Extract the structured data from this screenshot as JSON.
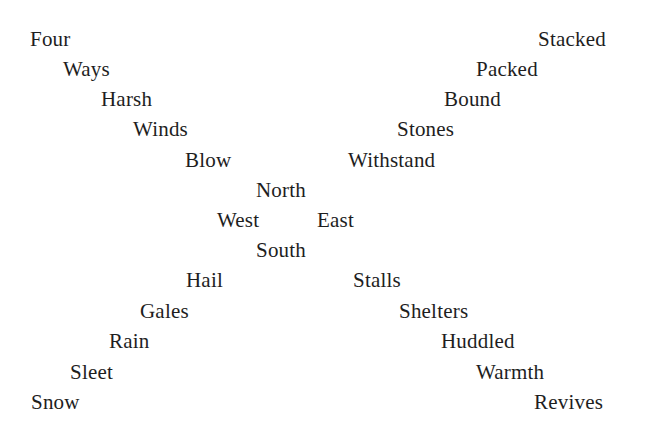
{
  "poem": {
    "left_arm_top": [
      {
        "text": "Four",
        "x": 30,
        "y": 27
      },
      {
        "text": "Ways",
        "x": 63,
        "y": 57
      },
      {
        "text": "Harsh",
        "x": 101,
        "y": 87
      },
      {
        "text": "Winds",
        "x": 133,
        "y": 117
      },
      {
        "text": "Blow",
        "x": 185,
        "y": 148
      }
    ],
    "right_arm_top": [
      {
        "text": "Stacked",
        "x": 538,
        "y": 27
      },
      {
        "text": "Packed",
        "x": 476,
        "y": 57
      },
      {
        "text": "Bound",
        "x": 444,
        "y": 87
      },
      {
        "text": "Stones",
        "x": 397,
        "y": 117
      },
      {
        "text": "Withstand",
        "x": 348,
        "y": 148
      }
    ],
    "center": {
      "north": {
        "text": "North",
        "x": 256,
        "y": 178
      },
      "west": {
        "text": "West",
        "x": 217,
        "y": 208
      },
      "east": {
        "text": "East",
        "x": 317,
        "y": 208
      },
      "south": {
        "text": "South",
        "x": 256,
        "y": 238
      }
    },
    "left_arm_bottom": [
      {
        "text": "Hail",
        "x": 186,
        "y": 268
      },
      {
        "text": "Gales",
        "x": 140,
        "y": 299
      },
      {
        "text": "Rain",
        "x": 109,
        "y": 329
      },
      {
        "text": "Sleet",
        "x": 70,
        "y": 360
      },
      {
        "text": "Snow",
        "x": 31,
        "y": 390
      }
    ],
    "right_arm_bottom": [
      {
        "text": "Stalls",
        "x": 353,
        "y": 268
      },
      {
        "text": "Shelters",
        "x": 399,
        "y": 299
      },
      {
        "text": "Huddled",
        "x": 441,
        "y": 329
      },
      {
        "text": "Warmth",
        "x": 476,
        "y": 360
      },
      {
        "text": "Revives",
        "x": 534,
        "y": 390
      }
    ]
  },
  "colors": {
    "text": "#1e1e1e",
    "background": "#ffffff"
  }
}
